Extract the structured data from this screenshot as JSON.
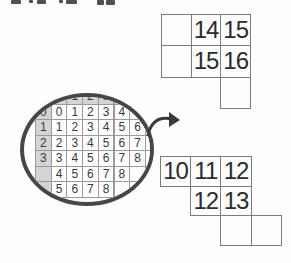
{
  "magnifier": {
    "grid_rows": [
      [
        "",
        "0",
        "1",
        "2",
        "3",
        "4",
        "",
        ""
      ],
      [
        "0",
        "0",
        "1",
        "2",
        "3",
        "4",
        "",
        ""
      ],
      [
        "1",
        "1",
        "2",
        "3",
        "4",
        "5",
        "6",
        ""
      ],
      [
        "2",
        "2",
        "3",
        "4",
        "5",
        "6",
        "7",
        "8"
      ],
      [
        "3",
        "3",
        "4",
        "5",
        "6",
        "7",
        "8",
        "9"
      ],
      [
        "",
        "4",
        "5",
        "6",
        "7",
        "8",
        "",
        ""
      ],
      [
        "",
        "5",
        "6",
        "7",
        "8",
        "",
        "",
        ""
      ]
    ]
  },
  "pieces": {
    "top": {
      "cells": [
        {
          "row": 0,
          "col": 0,
          "value": ""
        },
        {
          "row": 0,
          "col": 1,
          "value": "14"
        },
        {
          "row": 0,
          "col": 2,
          "value": "15"
        },
        {
          "row": 1,
          "col": 0,
          "value": ""
        },
        {
          "row": 1,
          "col": 1,
          "value": "15"
        },
        {
          "row": 1,
          "col": 2,
          "value": "16"
        },
        {
          "row": 2,
          "col": 2,
          "value": ""
        }
      ]
    },
    "bottom": {
      "cells": [
        {
          "row": 0,
          "col": 0,
          "value": "10"
        },
        {
          "row": 0,
          "col": 1,
          "value": "11"
        },
        {
          "row": 0,
          "col": 2,
          "value": "12"
        },
        {
          "row": 1,
          "col": 1,
          "value": "12"
        },
        {
          "row": 1,
          "col": 2,
          "value": "13"
        },
        {
          "row": 2,
          "col": 2,
          "value": ""
        },
        {
          "row": 2,
          "col": 3,
          "value": ""
        }
      ]
    }
  },
  "colors": {
    "background": "#fdfdfd",
    "grid_line": "#9a9a9a",
    "piece_line": "#7b7b7b",
    "digit": "#2b2b2b",
    "shaded_cell": "#d4d4d4",
    "circle_border": "#474747",
    "arrow": "#3a3a3a"
  }
}
